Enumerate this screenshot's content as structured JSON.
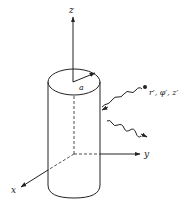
{
  "figure": {
    "colors": {
      "ink": "#222222",
      "background": "#ffffff"
    },
    "axes": {
      "z_label": "z",
      "y_label": "y",
      "x_label": "x"
    },
    "cylinder": {
      "radius_label": "a"
    },
    "source_point": {
      "label": "r′, φ′, z′"
    },
    "waves": [
      {
        "name": "incident-wave",
        "direction": "toward-cylinder"
      },
      {
        "name": "scattered-wave",
        "direction": "away-from-cylinder"
      }
    ]
  }
}
